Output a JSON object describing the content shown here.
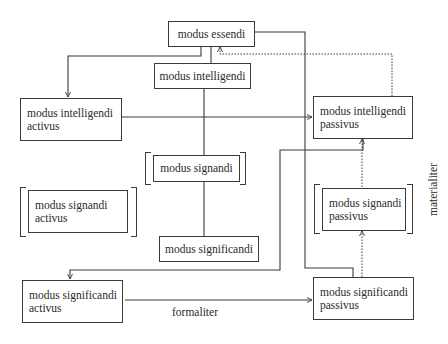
{
  "diagram": {
    "nodes": {
      "essendi": {
        "lines": [
          "modus essendi"
        ]
      },
      "intelligendi": {
        "lines": [
          "modus intelligendi"
        ]
      },
      "intelligendi_activus": {
        "lines": [
          "modus intelligendi",
          "activus"
        ]
      },
      "intelligendi_passivus": {
        "lines": [
          "modus intelligendi",
          "passivus"
        ]
      },
      "signandi": {
        "lines": [
          "modus signandi"
        ]
      },
      "signandi_activus": {
        "lines": [
          "modus signandi",
          "activus"
        ]
      },
      "signandi_passivus": {
        "lines": [
          "modus signandi",
          "passivus"
        ]
      },
      "significandi": {
        "lines": [
          "modus significandi"
        ]
      },
      "significandi_activus": {
        "lines": [
          "modus significandi",
          "activus"
        ]
      },
      "significandi_passivus": {
        "lines": [
          "modus significandi",
          "passivus"
        ]
      }
    },
    "labels": {
      "formaliter": "formaliter",
      "materialiter": "materialiter"
    },
    "edges": [
      {
        "from": "essendi",
        "to": "intelligendi_activus",
        "style": "solid",
        "arrow": true
      },
      {
        "from": "essendi",
        "to": "intelligendi",
        "style": "solid",
        "arrow": false
      },
      {
        "from": "essendi",
        "to": "significandi_passivus",
        "style": "solid",
        "arrow": false
      },
      {
        "from": "intelligendi_passivus",
        "to": "essendi",
        "style": "dotted",
        "arrow": true
      },
      {
        "from": "intelligendi_activus",
        "to": "intelligendi_passivus",
        "style": "solid",
        "arrow": true
      },
      {
        "from": "intelligendi",
        "to": "signandi",
        "style": "solid",
        "arrow": false
      },
      {
        "from": "signandi",
        "to": "significandi",
        "style": "solid",
        "arrow": false
      },
      {
        "from": "intelligendi_passivus",
        "to": "significandi_activus",
        "style": "solid",
        "arrow": true
      },
      {
        "from": "signandi_passivus",
        "to": "intelligendi_passivus",
        "style": "dotted",
        "arrow": true
      },
      {
        "from": "significandi_passivus",
        "to": "signandi_passivus",
        "style": "dotted",
        "arrow": true
      },
      {
        "from": "significandi_activus",
        "to": "significandi_passivus",
        "style": "solid",
        "arrow": true,
        "label": "formaliter"
      }
    ]
  }
}
